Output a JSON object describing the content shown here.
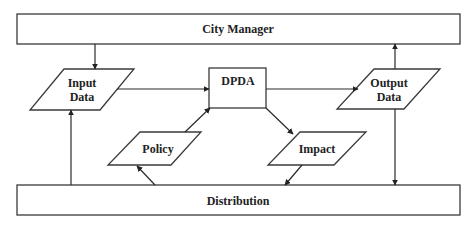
{
  "diagram": {
    "colors": {
      "stroke": "#3a3a3a",
      "text": "#222222",
      "background": "#ffffff"
    },
    "nodes": {
      "city_manager": {
        "label": "City Manager",
        "shape": "rectangle"
      },
      "distribution": {
        "label": "Distribution",
        "shape": "rectangle"
      },
      "dpda": {
        "label": "DPDA",
        "shape": "rectangle"
      },
      "input_data": {
        "line1": "Input",
        "line2": "Data",
        "shape": "parallelogram"
      },
      "output_data": {
        "line1": "Output",
        "line2": "Data",
        "shape": "parallelogram"
      },
      "policy": {
        "label": "Policy",
        "shape": "parallelogram"
      },
      "impact": {
        "label": "Impact",
        "shape": "parallelogram"
      }
    },
    "edges": [
      {
        "from": "City Manager",
        "to": "Input Data"
      },
      {
        "from": "Input Data",
        "to": "DPDA"
      },
      {
        "from": "DPDA",
        "to": "Output Data"
      },
      {
        "from": "Output Data",
        "to": "City Manager"
      },
      {
        "from": "Output Data",
        "to": "Distribution"
      },
      {
        "from": "Distribution",
        "to": "Input Data"
      },
      {
        "from": "Distribution",
        "to": "Policy"
      },
      {
        "from": "Policy",
        "to": "DPDA"
      },
      {
        "from": "DPDA",
        "to": "Impact"
      },
      {
        "from": "Impact",
        "to": "Distribution"
      }
    ]
  }
}
